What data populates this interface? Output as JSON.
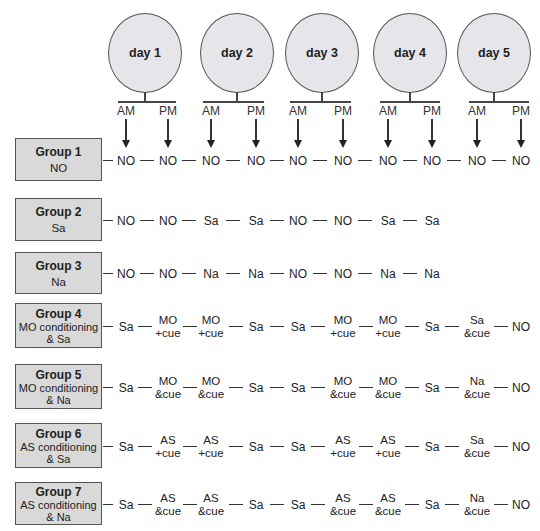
{
  "days": [
    {
      "label": "day 1",
      "cx": 145
    },
    {
      "label": "day 2",
      "cx": 237
    },
    {
      "label": "day 3",
      "cx": 322
    },
    {
      "label": "day 4",
      "cx": 410
    },
    {
      "label": "day 5",
      "cx": 494
    }
  ],
  "session_labels": [
    "AM",
    "PM",
    "AM",
    "PM",
    "AM",
    "PM",
    "AM",
    "PM",
    "AM",
    "PM"
  ],
  "columns_x": [
    126,
    168,
    211,
    256,
    298,
    343,
    388,
    432,
    477,
    521
  ],
  "groups": [
    {
      "title": "Group 1",
      "subtitle": [
        "NO"
      ],
      "top": 138,
      "height": 43,
      "sequence": [
        [
          "NO"
        ],
        [
          "NO"
        ],
        [
          "NO"
        ],
        [
          "NO"
        ],
        [
          "NO"
        ],
        [
          "NO"
        ],
        [
          "NO"
        ],
        [
          "NO"
        ],
        [
          "NO"
        ],
        [
          "NO"
        ]
      ]
    },
    {
      "title": "Group 2",
      "subtitle": [
        "Sa"
      ],
      "top": 198,
      "height": 43,
      "sequence": [
        [
          "NO"
        ],
        [
          "NO"
        ],
        [
          "Sa"
        ],
        [
          "Sa"
        ],
        [
          "NO"
        ],
        [
          "NO"
        ],
        [
          "Sa"
        ],
        [
          "Sa"
        ]
      ]
    },
    {
      "title": "Group 3",
      "subtitle": [
        "Na"
      ],
      "top": 252,
      "height": 42,
      "sequence": [
        [
          "NO"
        ],
        [
          "NO"
        ],
        [
          "Na"
        ],
        [
          "Na"
        ],
        [
          "NO"
        ],
        [
          "NO"
        ],
        [
          "Na"
        ],
        [
          "Na"
        ]
      ]
    },
    {
      "title": "Group 4",
      "subtitle": [
        "MO conditioning",
        "& Sa"
      ],
      "top": 303,
      "height": 45,
      "sequence": [
        [
          "Sa"
        ],
        [
          "MO",
          "+cue"
        ],
        [
          "MO",
          "+cue"
        ],
        [
          "Sa"
        ],
        [
          "Sa"
        ],
        [
          "MO",
          "+cue"
        ],
        [
          "MO",
          "+cue"
        ],
        [
          "Sa"
        ],
        [
          "Sa",
          "&cue"
        ],
        [
          "NO"
        ]
      ]
    },
    {
      "title": "Group 5",
      "subtitle": [
        "MO conditioning",
        "& Na"
      ],
      "top": 364,
      "height": 45,
      "sequence": [
        [
          "Sa"
        ],
        [
          "MO",
          "&cue"
        ],
        [
          "MO",
          "&cue"
        ],
        [
          "Sa"
        ],
        [
          "Sa"
        ],
        [
          "MO",
          "&cue"
        ],
        [
          "MO",
          "&cue"
        ],
        [
          "Sa"
        ],
        [
          "Na",
          "&cue"
        ],
        [
          "NO"
        ]
      ]
    },
    {
      "title": "Group 6",
      "subtitle": [
        "AS conditioning",
        "& Sa"
      ],
      "top": 423,
      "height": 45,
      "sequence": [
        [
          "Sa"
        ],
        [
          "AS",
          "+cue"
        ],
        [
          "AS",
          "+cue"
        ],
        [
          "Sa"
        ],
        [
          "Sa"
        ],
        [
          "AS",
          "+cue"
        ],
        [
          "AS",
          "+cue"
        ],
        [
          "Sa"
        ],
        [
          "Sa",
          "&cue"
        ],
        [
          "NO"
        ]
      ]
    },
    {
      "title": "Group 7",
      "subtitle": [
        "AS conditioning",
        "& Na"
      ],
      "top": 482,
      "height": 43,
      "sequence": [
        [
          "Sa"
        ],
        [
          "AS",
          "&cue"
        ],
        [
          "AS",
          "&cue"
        ],
        [
          "Sa"
        ],
        [
          "Sa"
        ],
        [
          "AS",
          "&cue"
        ],
        [
          "AS",
          "&cue"
        ],
        [
          "Sa"
        ],
        [
          "Na",
          "&cue"
        ],
        [
          "NO"
        ]
      ]
    }
  ],
  "colors": {
    "circle_fill": "#e6e6ea",
    "box_fill": "#d9d9d9",
    "stroke": "#555555"
  }
}
